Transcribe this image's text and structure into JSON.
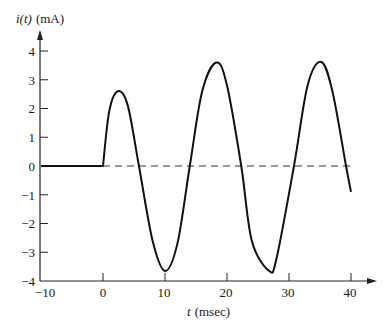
{
  "chart_data": {
    "type": "line",
    "title": "",
    "xlabel": "t (msec)",
    "ylabel": "i(t) (mA)",
    "xlim": [
      -10,
      40
    ],
    "ylim": [
      -4,
      4
    ],
    "xticks": [
      -10,
      0,
      10,
      20,
      30,
      40
    ],
    "yticks": [
      -4,
      -3,
      -2,
      -1,
      0,
      1,
      2,
      3,
      4
    ],
    "grid": false,
    "legend": null,
    "annotations": [
      "dashed zero reference line from t=0 to t=40"
    ],
    "series": [
      {
        "name": "i(t)",
        "description": "zero for t<0; for t>=0 sinusoid (~60 Hz, period ~16.7 ms) with transient, growing toward steady-state amplitude ~3.6 mA",
        "x": [
          -10,
          0,
          1,
          2.4,
          4,
          5.8,
          8,
          10,
          12,
          14,
          16,
          18.3,
          20,
          22.3,
          24,
          26.8,
          28,
          30.8,
          33,
          35.2,
          37,
          39.2,
          40
        ],
        "y": [
          0,
          0,
          1.9,
          2.6,
          2.1,
          0,
          -2.6,
          -3.65,
          -2.7,
          0,
          2.6,
          3.6,
          2.8,
          0,
          -2.6,
          -3.65,
          -3.2,
          0,
          2.8,
          3.62,
          2.6,
          0,
          -0.9
        ]
      }
    ]
  },
  "labels": {
    "ylabel_main": "i(t)",
    "ylabel_unit": "(mA)",
    "xlabel_var": "t",
    "xlabel_unit": "(msec)",
    "yticks": [
      "4",
      "3",
      "2",
      "1",
      "0",
      "−1",
      "−2",
      "−3",
      "−4"
    ],
    "xticks": [
      "−10",
      "0",
      "10",
      "20",
      "30",
      "40"
    ]
  },
  "colors": {
    "curve": "#111111",
    "axis": "#222222",
    "dashed": "#333333"
  }
}
